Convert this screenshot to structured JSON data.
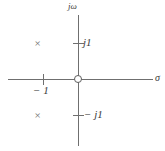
{
  "figure": {
    "type": "pole-zero-plot",
    "width": 165,
    "height": 151,
    "background_color": "#ffffff",
    "line_color": "#6f6f6f",
    "text_color": "#3a3a3a"
  },
  "axes": {
    "imaginary": {
      "label": "jω",
      "label_name": "j-omega-axis-label"
    },
    "real": {
      "label": "σ",
      "label_name": "sigma-axis-label"
    }
  },
  "ticks": [
    {
      "name": "tick-minus-1",
      "label": "− 1",
      "axis": "real",
      "value": -1
    },
    {
      "name": "tick-j1",
      "label": "j1",
      "axis": "imaginary",
      "value": 1
    },
    {
      "name": "tick-minus-j1",
      "label": "− j1",
      "axis": "imaginary",
      "value": -1
    }
  ],
  "markers": {
    "zeros": [
      {
        "name": "zero-at-origin",
        "glyph": "o",
        "real": 0,
        "imag": 0
      }
    ],
    "poles": [
      {
        "name": "pole-upper-left",
        "glyph": "×",
        "real": -1,
        "imag": 1
      },
      {
        "name": "pole-lower-left",
        "glyph": "×",
        "real": -1,
        "imag": -1
      }
    ]
  },
  "chart_data": {
    "type": "scatter",
    "title": "",
    "xlabel": "σ",
    "ylabel": "jω",
    "xlim": [
      -2.0,
      2.0
    ],
    "ylim": [
      -1.8,
      1.8
    ],
    "grid": false,
    "legend": null,
    "xticks": [
      -1
    ],
    "xticklabels": [
      "− 1"
    ],
    "yticks": [
      1,
      -1
    ],
    "yticklabels": [
      "j1",
      "− j1"
    ],
    "series": [
      {
        "name": "poles",
        "marker": "x",
        "x": [
          -1,
          -1
        ],
        "y": [
          1,
          -1
        ]
      },
      {
        "name": "zeros",
        "marker": "o",
        "x": [
          0
        ],
        "y": [
          0
        ]
      }
    ]
  }
}
